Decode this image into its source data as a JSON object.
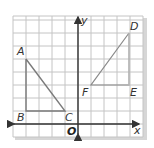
{
  "diagram": {
    "type": "coordinate-grid",
    "grid": {
      "x_min": -5,
      "x_max": 5,
      "y_min": -1,
      "y_max": 8,
      "unit_px": 13,
      "origin_px": [
        78,
        124
      ]
    },
    "axes": {
      "x_label": "x",
      "y_label": "y",
      "origin_label": "O"
    },
    "colors": {
      "grid": "#c4c4c4",
      "axis": "#333333",
      "shape": "#7a7a7a",
      "frame_shadow": "#d6d6d6"
    },
    "shapes": [
      {
        "name": "triangle-ABC",
        "vertices": [
          {
            "label": "A",
            "x": -4,
            "y": 5
          },
          {
            "label": "B",
            "x": -4,
            "y": 1
          },
          {
            "label": "C",
            "x": -1,
            "y": 1
          }
        ]
      },
      {
        "name": "triangle-DEF",
        "vertices": [
          {
            "label": "D",
            "x": 4,
            "y": 7
          },
          {
            "label": "E",
            "x": 4,
            "y": 3
          },
          {
            "label": "F",
            "x": 1,
            "y": 3
          }
        ]
      }
    ]
  }
}
